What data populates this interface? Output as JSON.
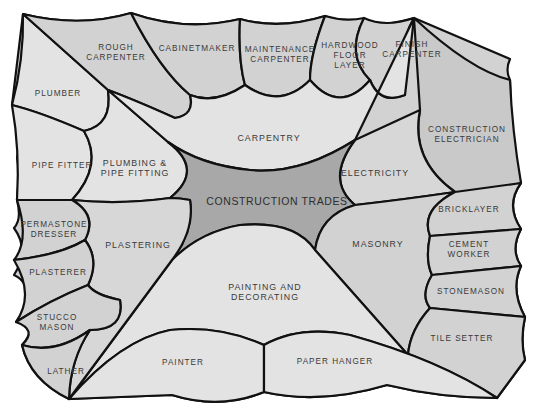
{
  "title": "Construction Trades",
  "colors": {
    "background": "#ffffff",
    "outline": "#111111",
    "hub": "#a8a8a8",
    "trade_light": "#e3e3e3",
    "trade_mid": "#d2d2d2",
    "specialty": "#cfcfcf",
    "text": "#3a3a3a"
  },
  "hub": {
    "label": "CONSTRUCTION TRADES"
  },
  "trades": [
    {
      "id": "carpentry",
      "label": "CARPENTRY",
      "specialties": [
        "ROUGH\nCARPENTER",
        "CABINETMAKER",
        "MAINTENANCE\nCARPENTER",
        "HARDWOOD\nFLOOR\nLAYER",
        "FINISH\nCARPENTER"
      ]
    },
    {
      "id": "electricity",
      "label": "ELECTRICITY",
      "specialties": [
        "CONSTRUCTION\nELECTRICIAN"
      ]
    },
    {
      "id": "masonry",
      "label": "MASONRY",
      "specialties": [
        "BRICKLAYER",
        "CEMENT\nWORKER",
        "STONEMASON",
        "TILE SETTER"
      ]
    },
    {
      "id": "painting",
      "label": "PAINTING AND\nDECORATING",
      "specialties": [
        "PAINTER",
        "PAPER HANGER"
      ]
    },
    {
      "id": "plastering",
      "label": "PLASTERING",
      "specialties": [
        "PERMASTONE\nDRESSER",
        "PLASTERER",
        "STUCCO\nMASON",
        "LATHER"
      ]
    },
    {
      "id": "plumbing",
      "label": "PLUMBING &\nPIPE FITTING",
      "specialties": [
        "PLUMBER",
        "PIPE FITTER"
      ]
    }
  ]
}
